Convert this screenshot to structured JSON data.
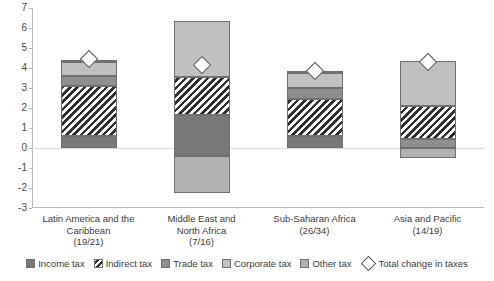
{
  "chart_data": {
    "type": "bar",
    "subtype": "stacked-bar-with-marker",
    "title": "",
    "xlabel": "",
    "ylabel": "",
    "ylim": [
      -3,
      7
    ],
    "ytick_labels": [
      "7",
      "6",
      "5",
      "4",
      "3",
      "2",
      "1",
      "0",
      "-1",
      "-2",
      "-3"
    ],
    "ytick_values": [
      7,
      6,
      5,
      4,
      3,
      2,
      1,
      0,
      -1,
      -2,
      -3
    ],
    "grid": false,
    "legend_position": "bottom",
    "categories": [
      "Latin America and the Caribbean (19/21)",
      "Middle East and North Africa (7/16)",
      "Sub-Saharan Africa (26/34)",
      "Asia and Pacific (14/19)"
    ],
    "series": [
      {
        "name": "Income tax",
        "values": [
          0.6,
          2.05,
          0.6,
          0.0
        ]
      },
      {
        "name": "Indirect tax",
        "values": [
          2.5,
          1.9,
          1.85,
          1.65
        ]
      },
      {
        "name": "Trade tax",
        "values": [
          0.5,
          0.0,
          0.55,
          0.45
        ]
      },
      {
        "name": "Corporate tax",
        "values": [
          0.7,
          2.8,
          0.75,
          2.25
        ]
      },
      {
        "name": "Other tax",
        "values": [
          0.1,
          1.85,
          0.1,
          0.5
        ]
      }
    ],
    "marker_series": {
      "name": "Total change in taxes",
      "values": [
        4.45,
        4.15,
        3.85,
        4.3
      ]
    }
  },
  "axis": {
    "ticks": [
      {
        "label": "7",
        "value": 7
      },
      {
        "label": "6",
        "value": 6
      },
      {
        "label": "5",
        "value": 5
      },
      {
        "label": "4",
        "value": 4
      },
      {
        "label": "3",
        "value": 3
      },
      {
        "label": "2",
        "value": 2
      },
      {
        "label": "1",
        "value": 1
      },
      {
        "label": "0",
        "value": 0
      },
      {
        "label": "-1",
        "value": -1
      },
      {
        "label": "-2",
        "value": -2
      },
      {
        "label": "-3",
        "value": -3
      }
    ]
  },
  "categories": [
    {
      "line1": "Latin America and the",
      "line2": "Caribbean",
      "line3": "(19/21)"
    },
    {
      "line1": "Middle East and",
      "line2": "North Africa",
      "line3": "(7/16)"
    },
    {
      "line1": "Sub-Saharan Africa",
      "line2": "",
      "line3": "(26/34)"
    },
    {
      "line1": "Asia and Pacific",
      "line2": "",
      "line3": "(14/19)"
    }
  ],
  "bars": [
    {
      "name": "latin-america-and-the-caribbean",
      "segments": [
        {
          "series": "Income tax",
          "from": 0.0,
          "to": 0.6
        },
        {
          "series": "Indirect tax",
          "from": 0.6,
          "to": 3.1
        },
        {
          "series": "Trade tax",
          "from": 3.1,
          "to": 3.6
        },
        {
          "series": "Corporate tax",
          "from": 3.6,
          "to": 4.3
        },
        {
          "series": "Other tax",
          "from": 4.3,
          "to": 4.4
        }
      ],
      "total": 4.45
    },
    {
      "name": "middle-east-and-north-africa",
      "segments": [
        {
          "series": "Other tax",
          "from": -2.25,
          "to": -0.4
        },
        {
          "series": "Income tax",
          "from": -0.4,
          "to": 1.65
        },
        {
          "series": "Indirect tax",
          "from": 1.65,
          "to": 3.55
        },
        {
          "series": "Corporate tax",
          "from": 3.55,
          "to": 6.35
        }
      ],
      "total": 4.15
    },
    {
      "name": "sub-saharan-africa",
      "segments": [
        {
          "series": "Income tax",
          "from": 0.0,
          "to": 0.6
        },
        {
          "series": "Indirect tax",
          "from": 0.6,
          "to": 2.45
        },
        {
          "series": "Trade tax",
          "from": 2.45,
          "to": 3.0
        },
        {
          "series": "Corporate tax",
          "from": 3.0,
          "to": 3.75
        },
        {
          "series": "Other tax",
          "from": 3.75,
          "to": 3.85
        }
      ],
      "total": 3.85
    },
    {
      "name": "asia-and-pacific",
      "segments": [
        {
          "series": "Other tax",
          "from": -0.5,
          "to": 0.0
        },
        {
          "series": "Trade tax",
          "from": 0.0,
          "to": 0.45
        },
        {
          "series": "Indirect tax",
          "from": 0.45,
          "to": 2.1
        },
        {
          "series": "Corporate tax",
          "from": 2.1,
          "to": 4.35
        }
      ],
      "total": 4.3
    }
  ],
  "legend": [
    {
      "label": "Income tax",
      "key": "income",
      "icon": "square-swatch-icon"
    },
    {
      "label": "Indirect tax",
      "key": "indirect",
      "icon": "hatched-swatch-icon"
    },
    {
      "label": "Trade tax",
      "key": "trade",
      "icon": "square-swatch-icon"
    },
    {
      "label": "Corporate tax",
      "key": "corporate",
      "icon": "square-swatch-icon"
    },
    {
      "label": "Other tax",
      "key": "other",
      "icon": "square-swatch-icon"
    },
    {
      "label": "Total change in taxes",
      "key": "diamond",
      "icon": "diamond-marker-icon"
    }
  ],
  "colors": {
    "income": "#787878",
    "trade": "#8e8e8e",
    "corporate": "#c0c0c0",
    "other": "#b2b2b2",
    "indirect_dark": "#2e2e2e",
    "marker_fill": "#ffffff",
    "axis": "#b9b9b9",
    "zero_line": "#d9d9d9",
    "text": "#3b3b3b"
  }
}
